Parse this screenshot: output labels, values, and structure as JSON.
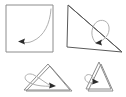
{
  "document": {
    "title": "Shape gesture figure",
    "background_color": "#ffffff",
    "width": 126,
    "height": 97,
    "description": "Four geometric line drawings each annotated with a curved gesture stroke ending in a solid arrowhead"
  },
  "palette": {
    "outline_light": "#8c8c8c",
    "outline_dark": "#5a5a5a",
    "gesture_stroke": "#b0b0b0",
    "arrow_fill": "#2b2b2b",
    "background": "#ffffff"
  },
  "panels": [
    {
      "id": "panel-square",
      "name": "square-panel",
      "shape": "square",
      "shape_label": "Square",
      "outline_points": "6,5 53,5 53,52 6,52 6,5",
      "outline_color": "#8c8c8c",
      "gesture_label": "Arc sweep from top-right to lower-left",
      "gesture_path": "M 51,9 C 50,24 44,36 33,41 C 29,43 25,43 22,42",
      "arrow_points": "18,41.5 25,38.5 24,41.5 25,44.5",
      "arrow_rotation": 0
    },
    {
      "id": "panel-right-triangle",
      "name": "right-triangle-panel",
      "shape": "right-triangle",
      "shape_label": "Right triangle",
      "outline_points": "68,5 67,47 122,52 68,5",
      "outline_color": "#5a5a5a",
      "secondary_outline_points": "68,5 122,52",
      "gesture_label": "Loop curling over the hypotenuse into the interior",
      "gesture_path": "M 97,44 C 92,40 90,32 94,25 C 98,18 108,19 109,27 C 110,35 104,40 99,42",
      "arrow_points": "95,43 102,39.5 101,42.5 102,45.5",
      "arrow_rotation": 0
    },
    {
      "id": "panel-wide-triangle",
      "name": "wide-triangle-panel",
      "shape": "triangle",
      "shape_label": "Wide triangle",
      "outline_points": "50,66 72,91 26,91 50,66",
      "outline_color": "#8c8c8c",
      "secondary_outline_points": "48,64 70,90 24,90 48,64",
      "gesture_label": "Flat loop entering from the left into the interior",
      "gesture_path": "M 54,86 C 42,87 30,85 26,80 C 23,76 28,72 34,75 C 40,78 46,84 52,86",
      "arrow_points": "56,86 49,82.5 50,85.5 49,88.5",
      "arrow_rotation": 0
    },
    {
      "id": "panel-narrow-triangle",
      "name": "narrow-triangle-panel",
      "shape": "triangle",
      "shape_label": "Narrow triangle",
      "outline_points": "101,64 113,91 88,91 101,64",
      "outline_color": "#8c8c8c",
      "secondary_outline_points": "99,62 111,89 86,89 99,62",
      "gesture_label": "Small loop entering from the left into the interior",
      "gesture_path": "M 97,82 C 92,84 86,83 85,79 C 84,75 89,73 92,76 C 95,79 94,82 95,82",
      "arrow_points": "99,82 92,78.5 93,81.5 92,84.5",
      "arrow_rotation": 0
    }
  ]
}
